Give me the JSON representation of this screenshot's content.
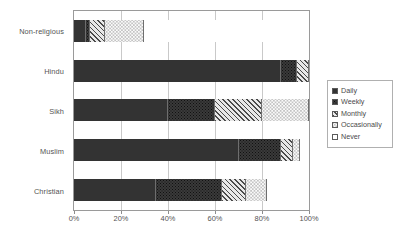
{
  "chart_data": {
    "type": "bar",
    "orientation": "horizontal",
    "stacked": true,
    "normalized_percent": true,
    "title": "",
    "xlabel": "",
    "ylabel": "",
    "xlim": [
      0,
      100
    ],
    "grid": true,
    "legend_position": "right",
    "categories": [
      "Non-religious",
      "Hindu",
      "Sikh",
      "Muslim",
      "Christian"
    ],
    "xtick_labels": [
      "0%",
      "20%",
      "40%",
      "60%",
      "80%",
      "100%"
    ],
    "xtick_values": [
      0,
      20,
      40,
      60,
      80,
      100
    ],
    "series": [
      {
        "name": "Daily",
        "pattern": "solid-dark",
        "values": [
          5,
          88,
          40,
          70,
          35
        ]
      },
      {
        "name": "Weekly",
        "pattern": "dark-dotted",
        "values": [
          2,
          7,
          20,
          18,
          28
        ]
      },
      {
        "name": "Monthly",
        "pattern": "diagonal-hatch",
        "values": [
          6,
          5,
          20,
          5,
          10
        ]
      },
      {
        "name": "Occasionally",
        "pattern": "light-dotted",
        "values": [
          17,
          0,
          20,
          3,
          9
        ]
      },
      {
        "name": "Never",
        "pattern": "white",
        "values": [
          70,
          0,
          0,
          4,
          18
        ]
      }
    ]
  },
  "legend": {
    "items": [
      {
        "label": "Daily"
      },
      {
        "label": "Weekly"
      },
      {
        "label": "Monthly"
      },
      {
        "label": "Occasionally"
      },
      {
        "label": "Never"
      }
    ]
  }
}
